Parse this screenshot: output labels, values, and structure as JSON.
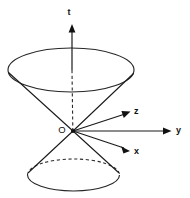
{
  "figure": {
    "type": "geometric-diagram",
    "background_color": "#ffffff",
    "stroke_color": "#1a1a1a",
    "width": 190,
    "height": 198
  },
  "labels": {
    "time_axis": "t",
    "z_axis": "z",
    "y_axis": "y",
    "x_axis": "x",
    "origin": "O"
  },
  "geometry": {
    "origin_point": {
      "x": 73,
      "y": 131
    },
    "upper_ellipse": {
      "cx": 71,
      "cy": 70,
      "rx": 63,
      "ry": 22
    },
    "lower_ellipse": {
      "cx": 73.5,
      "cy": 175,
      "rx": 46,
      "ry": 16
    },
    "t_axis_arrow_tip": {
      "x": 72,
      "y": 24
    },
    "z_axis_arrow_tip": {
      "x": 128,
      "y": 112
    },
    "y_axis_arrow_tip": {
      "x": 170,
      "y": 131
    },
    "x_axis_arrow_tip": {
      "x": 128,
      "y": 152
    }
  },
  "elements": {
    "upper_cone": "solid ellipse with two slant generator lines meeting at origin",
    "lower_cone": "solid ellipse with dashed back arc and two slant generator lines meeting at origin",
    "vertical_axis": "solid above upper ellipse, dashed between upper ellipse and origin"
  }
}
